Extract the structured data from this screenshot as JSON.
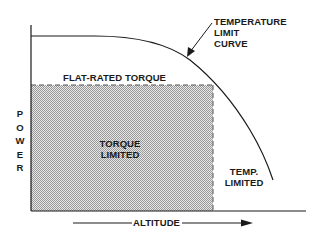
{
  "diagram": {
    "type": "performance-envelope",
    "y_axis_label": "POWER",
    "y_axis_letters": [
      "P",
      "O",
      "W",
      "E",
      "R"
    ],
    "x_axis_label": "ALTITUDE",
    "curve_label": [
      "TEMPERATURE",
      "LIMIT",
      "CURVE"
    ],
    "flat_rated_label": "FLAT-RATED TORQUE",
    "region_torque": [
      "TORQUE",
      "LIMITED"
    ],
    "region_temp": [
      "TEMP.",
      "LIMITED"
    ]
  },
  "colors": {
    "line": "#1a1a1a",
    "shading": "#bdbdbd",
    "background": "#ffffff"
  }
}
